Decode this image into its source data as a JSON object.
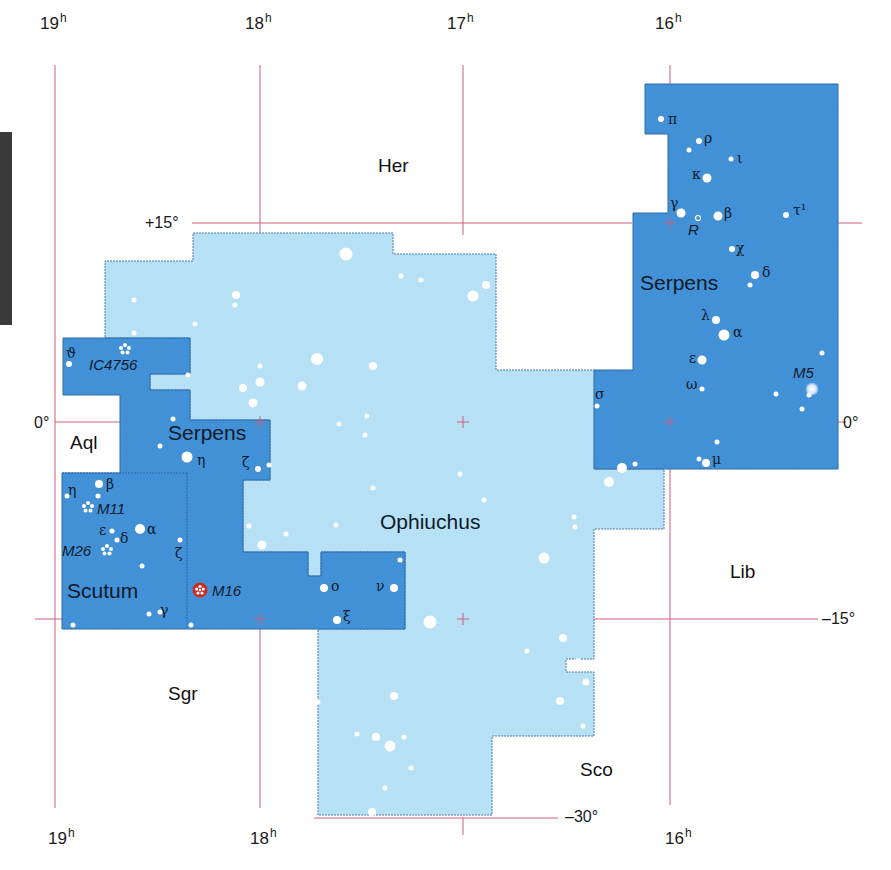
{
  "colors": {
    "serpens": "#3f8fd6",
    "ophiuchus": "#b5e0f5",
    "border": "#4a7aa8",
    "grid": "#d0607a",
    "star": "#ffffff",
    "m16": "#cc2a22"
  },
  "ra_labels": {
    "top": [
      {
        "id": "ra19",
        "value": "19",
        "unit": "h",
        "x": 40,
        "y": 10
      },
      {
        "id": "ra18",
        "value": "18",
        "unit": "h",
        "x": 245,
        "y": 10
      },
      {
        "id": "ra17",
        "value": "17",
        "unit": "h",
        "x": 447,
        "y": 10
      },
      {
        "id": "ra16",
        "value": "16",
        "unit": "h",
        "x": 655,
        "y": 10
      }
    ],
    "bottom": [
      {
        "id": "ra19b",
        "value": "19",
        "unit": "h",
        "x": 48,
        "y": 825
      },
      {
        "id": "ra18b",
        "value": "18",
        "unit": "h",
        "x": 250,
        "y": 825
      },
      {
        "id": "ra16b",
        "value": "16",
        "unit": "h",
        "x": 665,
        "y": 825
      }
    ]
  },
  "dec_labels": [
    {
      "id": "dec+15",
      "text": "+15°",
      "x": 145,
      "y": 215
    },
    {
      "id": "dec0left",
      "text": "0°",
      "x": 35,
      "y": 415
    },
    {
      "id": "dec0right",
      "text": "0°",
      "x": 843,
      "y": 415
    },
    {
      "id": "dec-15",
      "text": "–15°",
      "x": 825,
      "y": 610
    },
    {
      "id": "dec-30",
      "text": "–30°",
      "x": 565,
      "y": 808
    }
  ],
  "constellations": [
    {
      "id": "her",
      "text": "Her",
      "x": 378,
      "y": 155,
      "cls": "const"
    },
    {
      "id": "aql",
      "text": "Aql",
      "x": 70,
      "y": 432,
      "cls": "const"
    },
    {
      "id": "lib",
      "text": "Lib",
      "x": 730,
      "y": 562,
      "cls": "const"
    },
    {
      "id": "sgr",
      "text": "Sgr",
      "x": 168,
      "y": 683,
      "cls": "const"
    },
    {
      "id": "sco",
      "text": "Sco",
      "x": 580,
      "y": 760,
      "cls": "const"
    },
    {
      "id": "ophiuchus",
      "text": "Ophiuchus",
      "x": 380,
      "y": 511,
      "cls": "big"
    },
    {
      "id": "serpens-caput",
      "text": "Serpens",
      "x": 640,
      "y": 272,
      "cls": "big"
    },
    {
      "id": "serpens-cauda",
      "text": "Serpens",
      "x": 168,
      "y": 422,
      "cls": "big"
    },
    {
      "id": "scutum",
      "text": "Scutum",
      "x": 67,
      "y": 580,
      "cls": "big"
    }
  ],
  "star_labels": [
    {
      "id": "pi",
      "text": "π",
      "x": 668,
      "y": 112
    },
    {
      "id": "rho",
      "text": "ρ",
      "x": 704,
      "y": 132
    },
    {
      "id": "iota",
      "text": "ι",
      "x": 737,
      "y": 151
    },
    {
      "id": "kappa",
      "text": "κ",
      "x": 692,
      "y": 167
    },
    {
      "id": "gamma-ser",
      "text": "γ",
      "x": 670,
      "y": 197
    },
    {
      "id": "beta-ser",
      "text": "β",
      "x": 724,
      "y": 205
    },
    {
      "id": "tau1",
      "text": "τ¹",
      "x": 793,
      "y": 200
    },
    {
      "id": "chi",
      "text": "χ",
      "x": 736,
      "y": 242
    },
    {
      "id": "delta-ser",
      "text": "δ",
      "x": 762,
      "y": 266
    },
    {
      "id": "lambda",
      "text": "λ",
      "x": 701,
      "y": 308
    },
    {
      "id": "alpha-ser",
      "text": "α",
      "x": 733,
      "y": 325
    },
    {
      "id": "epsilon-ser",
      "text": "ε",
      "x": 689,
      "y": 352
    },
    {
      "id": "omega",
      "text": "ω",
      "x": 686,
      "y": 377
    },
    {
      "id": "sigma",
      "text": "σ",
      "x": 595,
      "y": 387
    },
    {
      "id": "mu",
      "text": "μ",
      "x": 712,
      "y": 453
    },
    {
      "id": "theta-ser",
      "text": "ϑ",
      "x": 66,
      "y": 346
    },
    {
      "id": "eta-ser",
      "text": "η",
      "x": 197,
      "y": 454
    },
    {
      "id": "zeta-ser",
      "text": "ζ",
      "x": 242,
      "y": 455
    },
    {
      "id": "eta-sct",
      "text": "η",
      "x": 68,
      "y": 483
    },
    {
      "id": "beta-sct",
      "text": "β",
      "x": 106,
      "y": 477
    },
    {
      "id": "epsilon-sct",
      "text": "ε",
      "x": 99,
      "y": 523
    },
    {
      "id": "alpha-sct",
      "text": "α",
      "x": 147,
      "y": 523
    },
    {
      "id": "delta-sct",
      "text": "δ",
      "x": 120,
      "y": 531
    },
    {
      "id": "zeta-sct",
      "text": "ζ",
      "x": 175,
      "y": 546
    },
    {
      "id": "gamma-sct",
      "text": "γ",
      "x": 160,
      "y": 604
    },
    {
      "id": "omicron",
      "text": "ο",
      "x": 330,
      "y": 580
    },
    {
      "id": "nu",
      "text": "ν",
      "x": 376,
      "y": 580
    },
    {
      "id": "xi",
      "text": "ξ",
      "x": 343,
      "y": 610
    }
  ],
  "objects": [
    {
      "id": "ic4756",
      "text": "IC4756",
      "x": 89,
      "y": 357
    },
    {
      "id": "m11",
      "text": "M11",
      "x": 97,
      "y": 502
    },
    {
      "id": "m26",
      "text": "M26",
      "x": 62,
      "y": 544
    },
    {
      "id": "m16",
      "text": "M16",
      "x": 212,
      "y": 584
    },
    {
      "id": "m5",
      "text": "M5",
      "x": 793,
      "y": 366
    },
    {
      "id": "r-ser",
      "text": "R",
      "x": 688,
      "y": 222
    }
  ]
}
